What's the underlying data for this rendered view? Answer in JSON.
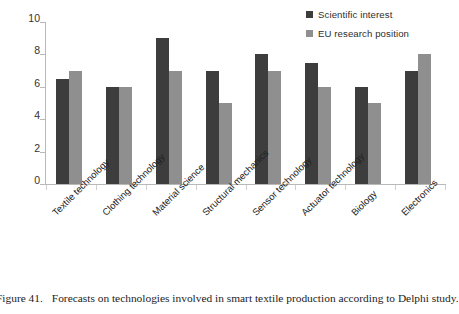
{
  "caption": {
    "number": "Figure 41.",
    "text": "Forecasts on technologies involved in smart textile production according to Delphi study."
  },
  "colors": {
    "series_dark": "#3d3d3d",
    "series_light": "#8f8f8f",
    "axis": "#b9b9b9",
    "text": "#2b2b2b",
    "background": "#ffffff"
  },
  "legend": {
    "position": "top-right",
    "entries": [
      {
        "label": "Scientific interest",
        "color": "#3d3d3d",
        "swatch_icon": "square-swatch-icon"
      },
      {
        "label": "EU research position",
        "color": "#8f8f8f",
        "swatch_icon": "square-swatch-icon"
      }
    ]
  },
  "chart_data": {
    "type": "bar",
    "title": "",
    "subtitle": "",
    "xlabel": "",
    "ylabel": "",
    "ylim": [
      0,
      10
    ],
    "yticks": [
      0,
      2,
      4,
      6,
      8,
      10
    ],
    "ytick_labels": [
      "0",
      "2",
      "4",
      "6",
      "8",
      "10"
    ],
    "grid": false,
    "legend_position": "top-right",
    "categories": [
      "Textile technology",
      "Clothing technology",
      "Material science",
      "Structural mechanics",
      "Sensor technology",
      "Actuator technology",
      "Biology",
      "Electronics"
    ],
    "series": [
      {
        "name": "Scientific interest",
        "color": "#3d3d3d",
        "values": [
          6.5,
          6,
          9,
          7,
          8,
          7.5,
          6,
          7
        ]
      },
      {
        "name": "EU research position",
        "color": "#8f8f8f",
        "values": [
          7,
          6,
          7,
          5,
          7,
          6,
          5,
          8
        ]
      }
    ],
    "annotations": []
  }
}
